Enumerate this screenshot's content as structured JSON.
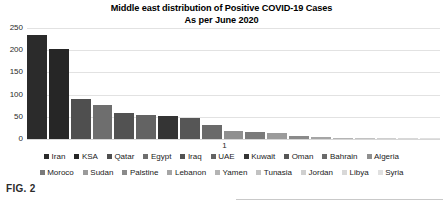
{
  "figure": {
    "caption": "FIG. 2"
  },
  "chart_data": {
    "type": "bar",
    "title": "Middle east distribution of Positive COVID-19 Cases",
    "subtitle": "As per June 2020",
    "title_lines": [
      "Middle east distribution of Positive COVID-19 Cases",
      "As per June 2020"
    ],
    "xlabel": "",
    "ylabel": "",
    "x_tick_labels": [
      "1"
    ],
    "ylim": [
      0,
      250
    ],
    "yticks": [
      0,
      50,
      100,
      150,
      200,
      250
    ],
    "ytick_labels": [
      "0",
      "50",
      "100",
      "150",
      "200",
      "250"
    ],
    "grid": true,
    "grid_axis": "y",
    "legend_position": "bottom",
    "legend_rows": [
      [
        "Iran",
        "KSA",
        "Qatar",
        "Egypt",
        "Iraq",
        "UAE",
        "Kuwait",
        "Oman",
        "Bahrain",
        "Algeria"
      ],
      [
        "Moroco",
        "Sudan",
        "Palstine",
        "Lebanon",
        "Yamen",
        "Tunasia",
        "Jordan",
        "Libya",
        "Syria"
      ]
    ],
    "categories": [
      "Iran",
      "KSA",
      "Qatar",
      "Egypt",
      "Iraq",
      "UAE",
      "Kuwait",
      "Oman",
      "Bahrain",
      "Algeria",
      "Moroco",
      "Sudan",
      "Palstine",
      "Lebanon",
      "Yamen",
      "Tunasia",
      "Jordan",
      "Libya",
      "Syria"
    ],
    "values": [
      235,
      203,
      90,
      76,
      59,
      53,
      52,
      48,
      32,
      18,
      16,
      13,
      7,
      5,
      3,
      2,
      1.5,
      1,
      0.5
    ],
    "colors": [
      "#2b2b2b",
      "#262626",
      "#4f4f4f",
      "#6e6e6e",
      "#525252",
      "#636363",
      "#343434",
      "#565656",
      "#6a6a6a",
      "#8f8f8f",
      "#7a7a7a",
      "#9b9b9b",
      "#8a8a8a",
      "#a5a5a5",
      "#b4b4b4",
      "#c2c2c2",
      "#cfcfcf",
      "#d8d8d8",
      "#e0e0e0"
    ],
    "legend_colors": [
      "#2b2b2b",
      "#262626",
      "#4f4f4f",
      "#6e6e6e",
      "#525252",
      "#636363",
      "#343434",
      "#565656",
      "#6a6a6a",
      "#8f8f8f",
      "#7a7a7a",
      "#9b9b9b",
      "#8a8a8a",
      "#a5a5a5",
      "#b4b4b4",
      "#c2c2c2",
      "#cfcfcf",
      "#d8d8d8",
      "#e0e0e0"
    ]
  }
}
